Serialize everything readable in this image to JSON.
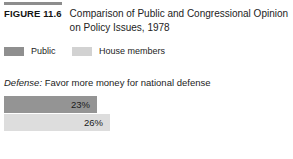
{
  "figure": {
    "rule": "horizontal-rule",
    "label": "FIGURE 11.6",
    "title": "Comparison of Public and Congressional Opinion on Policy Issues, 1978"
  },
  "legend": {
    "entries": [
      {
        "label": "Public",
        "color": "#8f8f8f",
        "swatch_name": "legend-swatch-public"
      },
      {
        "label": "House members",
        "color": "#d2d2d2",
        "swatch_name": "legend-swatch-house-members"
      }
    ]
  },
  "issue": {
    "topic": "Defense:",
    "question": " Favor more money for national defense"
  },
  "chart_data": {
    "type": "bar",
    "orientation": "horizontal",
    "title": "Comparison of Public and Congressional Opinion on Policy Issues, 1978",
    "subtitle": "Defense: Favor more money for national defense",
    "categories": [
      "Defense: Favor more money for national defense"
    ],
    "series": [
      {
        "name": "Public",
        "values": [
          23
        ],
        "labels": [
          "23%"
        ],
        "color": "#949494"
      },
      {
        "name": "House members",
        "values": [
          26
        ],
        "labels": [
          "26%"
        ],
        "color": "#dddddd"
      }
    ],
    "xlabel": "",
    "ylabel": "",
    "xlim": [
      0,
      100
    ],
    "grid": false,
    "legend_position": "top-left",
    "value_suffix": "%"
  }
}
